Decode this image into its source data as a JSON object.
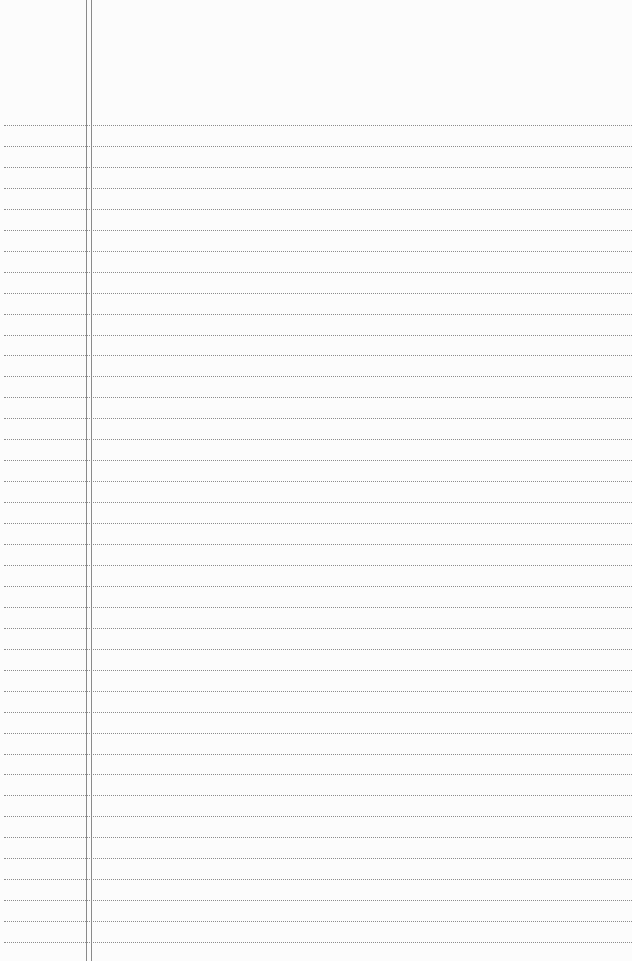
{
  "document": {
    "type": "lined-paper",
    "background_color": "#fcfcfc",
    "rule_color": "#8c8c8c",
    "margin_color": "#8a8a8a",
    "rules": {
      "count": 40,
      "first_y": 125,
      "spacing": 20.95
    },
    "margin_lines_x": [
      86,
      91
    ],
    "text_content": ""
  }
}
